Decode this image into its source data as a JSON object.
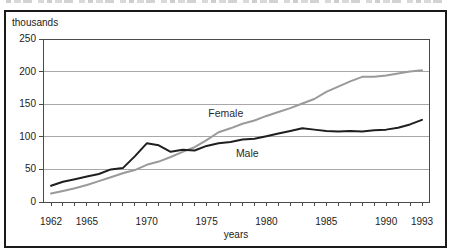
{
  "figure": {
    "caption_cropped": true
  },
  "chart_data": {
    "type": "line",
    "title": "",
    "ylabel": "thousands",
    "xlabel": "years",
    "ylim": [
      0,
      250
    ],
    "yticks": [
      0,
      50,
      100,
      150,
      200,
      250
    ],
    "xtick_labels": [
      1962,
      1965,
      1970,
      1975,
      1980,
      1985,
      1990,
      1993
    ],
    "grid": "horizontal",
    "legend": "inline-labels",
    "x": [
      1962,
      1963,
      1964,
      1965,
      1966,
      1967,
      1968,
      1969,
      1970,
      1971,
      1972,
      1973,
      1974,
      1975,
      1976,
      1977,
      1978,
      1979,
      1980,
      1981,
      1982,
      1983,
      1984,
      1985,
      1986,
      1987,
      1988,
      1989,
      1990,
      1991,
      1992,
      1993
    ],
    "series": [
      {
        "name": "Female",
        "color": "#9a9a9a",
        "values": [
          13,
          17,
          21,
          26,
          32,
          38,
          44,
          49,
          57,
          62,
          69,
          77,
          84,
          95,
          107,
          113,
          120,
          125,
          132,
          138,
          144,
          151,
          158,
          169,
          177,
          185,
          192,
          192,
          194,
          197,
          200,
          202
        ]
      },
      {
        "name": "Male",
        "color": "#1f1f1f",
        "values": [
          25,
          31,
          35,
          39,
          43,
          50,
          52,
          70,
          90,
          87,
          77,
          80,
          79,
          86,
          90,
          92,
          96,
          97,
          101,
          105,
          109,
          113,
          111,
          109,
          108,
          109,
          108,
          110,
          111,
          114,
          119,
          126
        ]
      }
    ],
    "inline_labels": [
      {
        "text": "Female",
        "x": 1976.6,
        "y": 135
      },
      {
        "text": "Male",
        "x": 1978.4,
        "y": 74
      }
    ]
  }
}
